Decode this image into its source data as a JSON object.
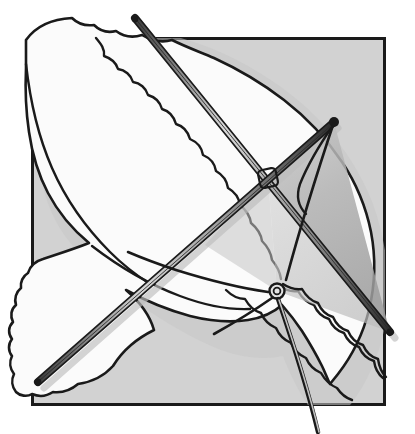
{
  "artwork": {
    "title": "Kite and bird line illustration",
    "medium": "pen-and-ink line art with flat gray tones",
    "canvas": {
      "width": 415,
      "height": 434,
      "background_color": "#ffffff"
    },
    "palette": {
      "ink": "#1a1a1a",
      "panel_gray": "#d2d2d2",
      "sail_gray": "#b4b4b4",
      "sail_gray_dark": "#a0a0a0",
      "bird_white": "#fbfbfb",
      "shadow_gray": "#c8c8c8",
      "paper_white": "#ffffff"
    },
    "elements": [
      {
        "name": "background-panel",
        "description": "Light gray square panel behind the subjects, outlined in black ink",
        "shape": "square",
        "color": "#d2d2d2",
        "bounds": {
          "x": 32,
          "y": 38,
          "width": 353,
          "height": 367
        }
      },
      {
        "name": "bird-silhouette",
        "description": "White gull-like bird in flight with outstretched wings and scalloped feather trailing edges, drawn over the gray panel and breaking past its left, top and bottom-right borders",
        "color": "#fbfbfb",
        "feature_count": 2,
        "features": [
          "upper-wing",
          "lower-wing",
          "body",
          "scalloped-feather-edges"
        ]
      },
      {
        "name": "kite",
        "description": "Diamond kite with two crossed wooden spars, a translucent gray sail, bridle lines and a flying line trailing off the bottom of the panel",
        "sail_color": "#b4b4b4",
        "spar_count": 2,
        "spars": [
          {
            "name": "spar-upper-left-to-lower-right",
            "from": [
              135,
              18
            ],
            "to": [
              390,
              332
            ]
          },
          {
            "name": "spar-upper-right-to-lower-left",
            "from": [
              334,
              122
            ],
            "to": [
              38,
              382
            ]
          }
        ],
        "cross_point": [
          268,
          178
        ],
        "bridle_knot": [
          277,
          291
        ],
        "flying_line_exit": [
          318,
          432
        ]
      }
    ]
  }
}
